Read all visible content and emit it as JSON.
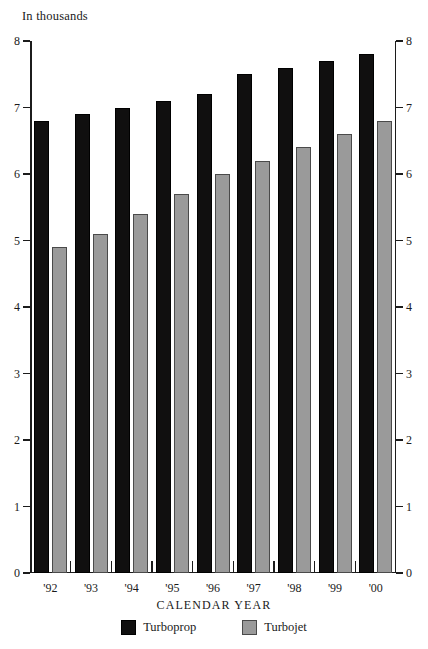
{
  "chart_data": {
    "type": "bar",
    "title": "",
    "unit_note": "In thousands",
    "xlabel": "CALENDAR YEAR",
    "ylabel": "",
    "ylim": [
      0,
      8
    ],
    "yticks": [
      0,
      1,
      2,
      3,
      4,
      5,
      6,
      7,
      8
    ],
    "grid": false,
    "legend_position": "bottom",
    "dual_y_axis": true,
    "categories": [
      "'92",
      "'93",
      "'94",
      "'95",
      "'96",
      "'97",
      "'98",
      "'99",
      "'00"
    ],
    "series": [
      {
        "name": "Turboprop",
        "color": "#100f0f",
        "values": [
          6.8,
          6.9,
          7.0,
          7.1,
          7.2,
          7.5,
          7.6,
          7.7,
          7.8
        ]
      },
      {
        "name": "Turbojet",
        "color": "#9a9a9a",
        "values": [
          4.9,
          5.1,
          5.4,
          5.7,
          6.0,
          6.2,
          6.4,
          6.6,
          6.8
        ]
      }
    ]
  },
  "axes": {
    "left_tick_labels": [
      "8",
      "7",
      "6",
      "5",
      "4",
      "3",
      "2",
      "1",
      "0"
    ],
    "right_tick_labels": [
      "8",
      "7",
      "6",
      "5",
      "4",
      "3",
      "2",
      "1",
      "0"
    ]
  },
  "legend": {
    "items": [
      {
        "label": "Turboprop",
        "swatch": "black-square-swatch"
      },
      {
        "label": "Turbojet",
        "swatch": "gray-square-swatch"
      }
    ]
  },
  "colors": {
    "turboprop": "#100f0f",
    "turbojet": "#9a9a9a",
    "axis": "#1c1c1c",
    "background": "#ffffff"
  }
}
